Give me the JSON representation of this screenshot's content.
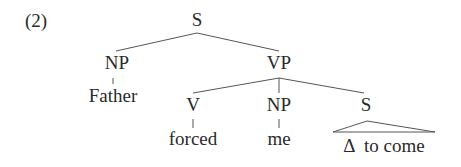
{
  "example_number": "(2)",
  "tree": {
    "root": {
      "label": "S"
    },
    "subject_np": {
      "label": "NP",
      "leaf": "Father"
    },
    "vp": {
      "label": "VP"
    },
    "verb": {
      "label": "V",
      "leaf": "forced"
    },
    "object_np": {
      "label": "NP",
      "leaf": "me"
    },
    "embedded_s": {
      "label": "S",
      "leaf_triangle": "Δ  to come"
    }
  }
}
